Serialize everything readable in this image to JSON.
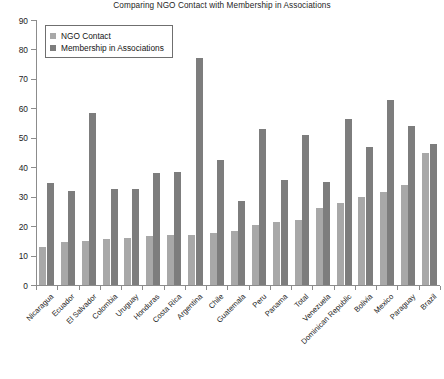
{
  "chart_data": {
    "type": "bar",
    "title": "Comparing NGO Contact with Membership in Associations",
    "xlabel": "",
    "ylabel": "",
    "ylim": [
      0,
      90
    ],
    "ytick_step": 10,
    "yticks": [
      0,
      10,
      20,
      30,
      40,
      50,
      60,
      70,
      80,
      90
    ],
    "grid": false,
    "legend_position": "top-left",
    "categories": [
      "Nicaragua",
      "Ecuador",
      "El Salvador",
      "Colombia",
      "Uruguay",
      "Honduras",
      "Costa Rica",
      "Argentina",
      "Chile",
      "Guatemala",
      "Peru",
      "Panama",
      "Total",
      "Venezuela",
      "Dominican Republic",
      "Bolivia",
      "Mexico",
      "Paraguay",
      "Brazil"
    ],
    "series": [
      {
        "name": "NGO Contact",
        "color": "#a8a8a8",
        "values": [
          13,
          14.5,
          15,
          15.5,
          16,
          16.5,
          17,
          17,
          17.5,
          18.5,
          20.5,
          21.5,
          22,
          26,
          28,
          30,
          31.5,
          34,
          45
        ]
      },
      {
        "name": "Membership in Associations",
        "color": "#7d7d7d",
        "values": [
          34.5,
          32,
          58.5,
          32.5,
          32.5,
          38,
          38.5,
          77,
          42.5,
          28.5,
          53,
          35.5,
          51,
          35,
          56.5,
          47,
          63,
          54,
          48
        ]
      }
    ]
  },
  "legend": {
    "items": [
      {
        "label": "NGO Contact"
      },
      {
        "label": "Membership in Associations"
      }
    ]
  },
  "colors": {
    "series_ngo": "#a8a8a8",
    "series_membership": "#7d7d7d",
    "axis": "#8c8c8c",
    "background": "#ffffff",
    "text": "#1a1a1a"
  }
}
